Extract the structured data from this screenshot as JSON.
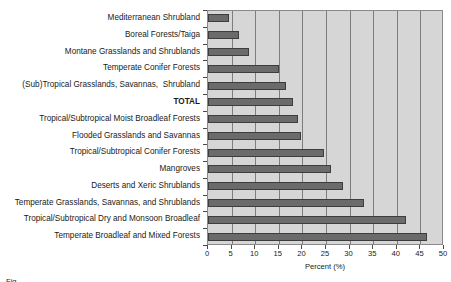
{
  "chart_data": {
    "type": "bar",
    "orientation": "horizontal",
    "title": "",
    "xlabel": "Percent (%)",
    "ylabel": "",
    "xlim": [
      0,
      50
    ],
    "xticks": [
      0,
      5,
      10,
      15,
      20,
      25,
      30,
      35,
      40,
      45,
      50
    ],
    "grid": true,
    "legend": null,
    "categories": [
      "Mediterranean Shrubland",
      "Boreal Forests/Taiga",
      "Montane Grasslands and Shrublands",
      "Temperate Conifer Forests",
      "(Sub)Tropical Grasslands, Savannas,  Shrubland",
      "TOTAL",
      "Tropical/Subtropical Moist Broadleaf Forests",
      "Flooded Grasslands and Savannas",
      "Tropical/Subtropical Conifer Forests",
      "Mangroves",
      "Deserts and Xeric Shrublands",
      "Temperate Grasslands, Savannas, and Shrublands",
      "Tropical/Subtropical Dry and Monsoon Broadleaf",
      "Temperate Broadleaf and Mixed Forests"
    ],
    "values": [
      4.5,
      6.5,
      8.7,
      15.0,
      16.5,
      18.0,
      19.0,
      19.7,
      24.5,
      26.0,
      28.5,
      33.0,
      42.0,
      46.3
    ],
    "highlight_category": "TOTAL",
    "bar_color": "#6b6b6b",
    "bar_edge_color": "#3d3d3d",
    "plot_background": "#d6d6d6",
    "gridline_color": "#7d7d7d"
  },
  "caption": {
    "partial_text": "Fig…"
  }
}
